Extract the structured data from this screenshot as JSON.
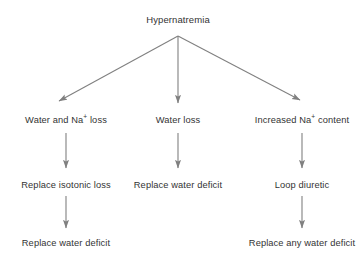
{
  "diagram": {
    "title": "Hypernatremia",
    "type": "flowchart",
    "background_color": "#ffffff",
    "line_color": "#808080",
    "text_color": "#333333",
    "root": {
      "label": "Hypernatremia",
      "x": 178,
      "y": 20
    },
    "branches": [
      {
        "id": "left",
        "cause_label_html": "Water and Na<sup>+</sup> loss",
        "cause_label": "Water and Na+ loss",
        "cause_x": 66,
        "cause_y": 120,
        "steps": [
          {
            "label": "Replace isotonic loss",
            "x": 66,
            "y": 185
          },
          {
            "label": "Replace water deficit",
            "x": 66,
            "y": 243
          }
        ]
      },
      {
        "id": "middle",
        "cause_label_html": "Water loss",
        "cause_label": "Water loss",
        "cause_x": 178,
        "cause_y": 120,
        "steps": [
          {
            "label": "Replace water deficit",
            "x": 178,
            "y": 185
          }
        ]
      },
      {
        "id": "right",
        "cause_label_html": "Increased Na<sup>+</sup> content",
        "cause_label": "Increased Na+ content",
        "cause_x": 302,
        "cause_y": 120,
        "steps": [
          {
            "label": "Loop diuretic",
            "x": 302,
            "y": 185
          },
          {
            "label": "Replace any water deficit",
            "x": 302,
            "y": 243
          }
        ]
      }
    ],
    "connectors": [
      {
        "name": "root-to-left",
        "x1": 178,
        "y1": 36,
        "x2": 59,
        "y2": 101
      },
      {
        "name": "root-to-middle",
        "x1": 178,
        "y1": 36,
        "x2": 178,
        "y2": 103
      },
      {
        "name": "root-to-right",
        "x1": 178,
        "y1": 36,
        "x2": 300,
        "y2": 100
      },
      {
        "name": "left-cause-to-step1",
        "x1": 66,
        "y1": 133,
        "x2": 66,
        "y2": 168
      },
      {
        "name": "middle-cause-to-step1",
        "x1": 178,
        "y1": 133,
        "x2": 178,
        "y2": 168
      },
      {
        "name": "right-cause-to-step1",
        "x1": 302,
        "y1": 133,
        "x2": 302,
        "y2": 168
      },
      {
        "name": "left-step1-to-step2",
        "x1": 66,
        "y1": 196,
        "x2": 66,
        "y2": 228
      },
      {
        "name": "right-step1-to-step2",
        "x1": 302,
        "y1": 196,
        "x2": 302,
        "y2": 228
      }
    ]
  }
}
